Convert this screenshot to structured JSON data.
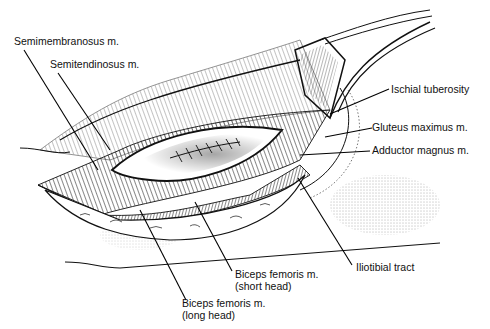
{
  "figure": {
    "type": "surgical anatomical illustration",
    "labels": {
      "semimembranosus": "Semimembranosus m.",
      "semitendinosus": "Semitendinosus m.",
      "ischial_tuberosity": "Ischial tuberosity",
      "gluteus_maximus": "Gluteus maximus m.",
      "adductor_magnus": "Adductor magnus m.",
      "iliotibial_tract": "Iliotibial tract",
      "biceps_short_line1": "Biceps femoris m.",
      "biceps_short_line2": "(short head)",
      "biceps_long_line1": "Biceps femoris m.",
      "biceps_long_line2": "(long head)"
    }
  }
}
